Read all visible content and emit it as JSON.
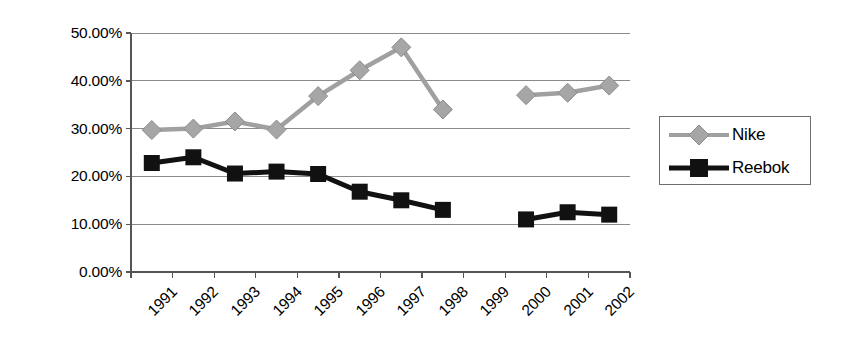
{
  "chart_data": {
    "type": "line",
    "title": "",
    "subtitle": "",
    "xlabel": "",
    "ylabel": "",
    "categories": [
      "1991",
      "1992",
      "1993",
      "1994",
      "1995",
      "1996",
      "1997",
      "1998",
      "1999",
      "2000",
      "2001",
      "2002"
    ],
    "ylim": [
      0,
      50
    ],
    "y_ticks": [
      0,
      10,
      20,
      30,
      40,
      50
    ],
    "y_tick_labels": [
      "0.00%",
      "10.00%",
      "20.00%",
      "30.00%",
      "40.00%",
      "50.00%"
    ],
    "grid": true,
    "grid_axis": "y",
    "legend_position": "right",
    "x_tick_label_rotation": -45,
    "series": [
      {
        "name": "Nike",
        "color": "#a0a0a0",
        "marker": "diamond",
        "values": [
          29.7,
          30.0,
          31.5,
          29.8,
          36.8,
          42.2,
          47.0,
          34.0,
          null,
          37.0,
          37.5,
          39.0
        ]
      },
      {
        "name": "Reebok",
        "color": "#111111",
        "marker": "square",
        "values": [
          22.8,
          24.0,
          20.6,
          21.0,
          20.5,
          16.8,
          15.0,
          13.0,
          null,
          11.0,
          12.5,
          12.0
        ]
      }
    ]
  },
  "legend": {
    "entries": [
      {
        "label": "Nike"
      },
      {
        "label": "Reebok"
      }
    ]
  },
  "axis_colors": {
    "axis_line": "#555555",
    "grid_line": "#8a8a8a",
    "text": "#000000"
  }
}
